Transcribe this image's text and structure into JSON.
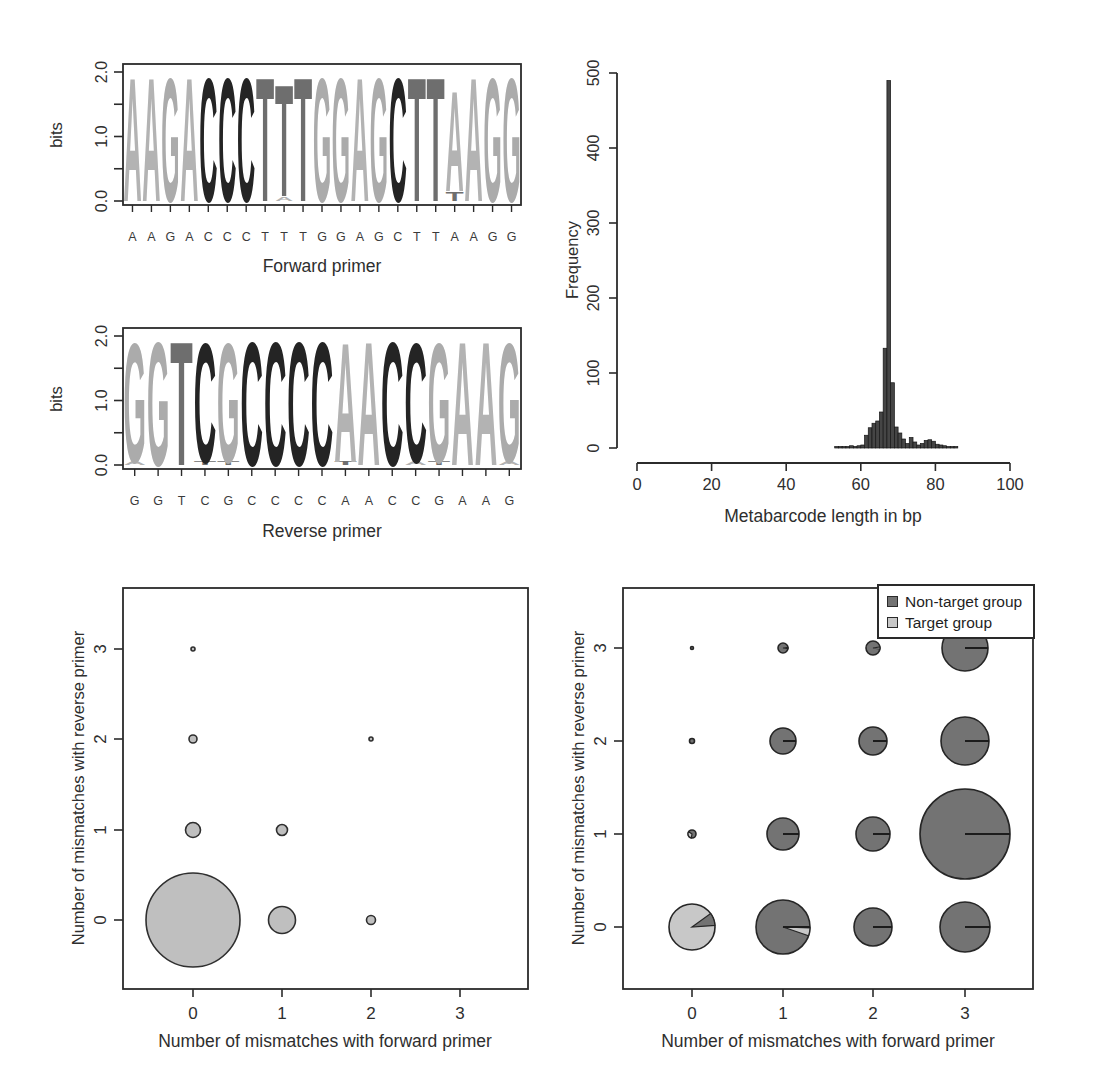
{
  "chart_data": [
    {
      "type": "sequence_logo",
      "title": "Forward primer",
      "ylabel": "bits",
      "ylim": [
        0.0,
        2.0
      ],
      "yticks": [
        "0.0",
        "1.0",
        "2.0"
      ],
      "sequence": "AAGACCCTTTGGAGCTTAAGG",
      "stacks": [
        [
          [
            "A",
            2.0
          ]
        ],
        [
          [
            "A",
            2.0
          ]
        ],
        [
          [
            "G",
            2.0
          ]
        ],
        [
          [
            "A",
            2.0
          ]
        ],
        [
          [
            "C",
            2.0
          ]
        ],
        [
          [
            "C",
            2.0
          ]
        ],
        [
          [
            "C",
            2.0
          ]
        ],
        [
          [
            "T",
            2.0
          ]
        ],
        [
          [
            "A",
            0.07
          ],
          [
            "T",
            1.8
          ]
        ],
        [
          [
            "T",
            2.0
          ]
        ],
        [
          [
            "G",
            2.0
          ]
        ],
        [
          [
            "G",
            2.0
          ]
        ],
        [
          [
            "A",
            2.0
          ]
        ],
        [
          [
            "G",
            2.0
          ]
        ],
        [
          [
            "C",
            2.0
          ]
        ],
        [
          [
            "T",
            2.0
          ]
        ],
        [
          [
            "T",
            2.0
          ]
        ],
        [
          [
            "T",
            0.15
          ],
          [
            "A",
            1.62
          ]
        ],
        [
          [
            "A",
            2.0
          ]
        ],
        [
          [
            "G",
            2.0
          ]
        ],
        [
          [
            "G",
            2.0
          ]
        ]
      ],
      "letter_colors": {
        "A": "#b3b3b3",
        "G": "#ababab",
        "C": "#242424",
        "T": "#6e6e6e"
      }
    },
    {
      "type": "sequence_logo",
      "title": "Reverse primer",
      "ylabel": "bits",
      "ylim": [
        0.0,
        2.0
      ],
      "yticks": [
        "0.0",
        "1.0",
        "2.0"
      ],
      "sequence": "GGTCGCCCCAACCGAAG",
      "stacks": [
        [
          [
            "A",
            0.05
          ],
          [
            "G",
            1.93
          ]
        ],
        [
          [
            "G",
            2.0
          ]
        ],
        [
          [
            "T",
            2.0
          ]
        ],
        [
          [
            "T",
            0.05
          ],
          [
            "C",
            1.93
          ]
        ],
        [
          [
            "T",
            0.05
          ],
          [
            "G",
            1.93
          ]
        ],
        [
          [
            "C",
            2.0
          ]
        ],
        [
          [
            "C",
            2.0
          ]
        ],
        [
          [
            "C",
            2.0
          ]
        ],
        [
          [
            "C",
            2.0
          ]
        ],
        [
          [
            "T",
            0.05
          ],
          [
            "A",
            1.93
          ]
        ],
        [
          [
            "A",
            2.0
          ]
        ],
        [
          [
            "C",
            2.0
          ]
        ],
        [
          [
            "A",
            0.05
          ],
          [
            "C",
            1.93
          ]
        ],
        [
          [
            "T",
            0.05
          ],
          [
            "G",
            1.93
          ]
        ],
        [
          [
            "A",
            2.0
          ]
        ],
        [
          [
            "A",
            2.0
          ]
        ],
        [
          [
            "A",
            0.05
          ],
          [
            "G",
            1.93
          ]
        ]
      ],
      "letter_colors": {
        "A": "#b3b3b3",
        "G": "#ababab",
        "C": "#242424",
        "T": "#6e6e6e"
      }
    },
    {
      "type": "bar",
      "title": "",
      "xlabel": "Metabarcode length in bp",
      "ylabel": "Frequency",
      "xlim": [
        0,
        100
      ],
      "ylim": [
        0,
        500
      ],
      "xticks": [
        0,
        20,
        40,
        60,
        80,
        100
      ],
      "yticks": [
        0,
        100,
        200,
        300,
        400,
        500
      ],
      "bar_color": "#454545",
      "x": [
        53,
        54,
        55,
        56,
        57,
        58,
        59,
        60,
        61,
        62,
        63,
        64,
        65,
        66,
        67,
        68,
        69,
        70,
        71,
        72,
        73,
        74,
        75,
        76,
        77,
        78,
        79,
        80,
        81,
        82,
        83,
        84,
        85
      ],
      "values": [
        2,
        2,
        2,
        2,
        3,
        2,
        3,
        4,
        17,
        27,
        33,
        36,
        48,
        133,
        490,
        87,
        28,
        20,
        12,
        6,
        14,
        8,
        4,
        6,
        10,
        11,
        9,
        5,
        4,
        3,
        2,
        2,
        2
      ]
    },
    {
      "type": "scatter",
      "title": "",
      "xlabel": "Number of mismatches with forward primer",
      "ylabel": "Number of mismatches with reverse primer",
      "xticks": [
        0,
        1,
        2,
        3
      ],
      "yticks": [
        0,
        1,
        2,
        3
      ],
      "bubble_fill": "#bfbfbf",
      "bubble_stroke": "#2f2f2f",
      "points": [
        {
          "x": 0,
          "y": 0,
          "r": 47
        },
        {
          "x": 1,
          "y": 0,
          "r": 13.5
        },
        {
          "x": 2,
          "y": 0,
          "r": 4.5
        },
        {
          "x": 0,
          "y": 1,
          "r": 7.5
        },
        {
          "x": 1,
          "y": 1,
          "r": 5.5
        },
        {
          "x": 0,
          "y": 2,
          "r": 4
        },
        {
          "x": 2,
          "y": 2,
          "r": 2
        },
        {
          "x": 0,
          "y": 3,
          "r": 2
        }
      ]
    },
    {
      "type": "scatter",
      "title": "",
      "xlabel": "Number of mismatches with forward primer",
      "ylabel": "Number of mismatches with reverse primer",
      "xticks": [
        0,
        1,
        2,
        3
      ],
      "yticks": [
        0,
        1,
        2,
        3
      ],
      "legend_position": "top-right",
      "legend": [
        {
          "label": "Non-target group",
          "color": "#737373"
        },
        {
          "label": "Target group",
          "color": "#c8c8c8"
        }
      ],
      "points": [
        {
          "x": 0,
          "y": 0,
          "r": 23,
          "style": "target",
          "wedge": {
            "color": "dark",
            "from": -36,
            "to": -4
          }
        },
        {
          "x": 1,
          "y": 0,
          "r": 27,
          "style": "dark",
          "line": true,
          "wedge": {
            "color": "light",
            "from": 2,
            "to": 19
          }
        },
        {
          "x": 2,
          "y": 0,
          "r": 19,
          "style": "dark",
          "line": true
        },
        {
          "x": 3,
          "y": 0,
          "r": 25,
          "style": "dark",
          "line": true
        },
        {
          "x": 0,
          "y": 1,
          "r": 4,
          "style": "dark",
          "wedge": {
            "color": "light",
            "from": 100,
            "to": 215
          }
        },
        {
          "x": 1,
          "y": 1,
          "r": 16,
          "style": "dark",
          "line": true
        },
        {
          "x": 2,
          "y": 1,
          "r": 17,
          "style": "dark",
          "line": true
        },
        {
          "x": 3,
          "y": 1,
          "r": 45,
          "style": "dark",
          "line": true
        },
        {
          "x": 0,
          "y": 2,
          "r": 2.5,
          "style": "dark"
        },
        {
          "x": 1,
          "y": 2,
          "r": 13,
          "style": "dark",
          "line": true
        },
        {
          "x": 2,
          "y": 2,
          "r": 14,
          "style": "dark",
          "line": true
        },
        {
          "x": 3,
          "y": 2,
          "r": 24,
          "style": "dark",
          "line": true
        },
        {
          "x": 0,
          "y": 3,
          "r": 1.5,
          "style": "dark"
        },
        {
          "x": 1,
          "y": 3,
          "r": 5,
          "style": "dark",
          "wedge": {
            "color": "light",
            "from": -8,
            "to": 8
          }
        },
        {
          "x": 2,
          "y": 3,
          "r": 7,
          "style": "dark",
          "wedge": {
            "color": "light",
            "from": -8,
            "to": 8
          }
        },
        {
          "x": 3,
          "y": 3,
          "r": 23,
          "style": "dark",
          "line": true
        }
      ]
    }
  ]
}
